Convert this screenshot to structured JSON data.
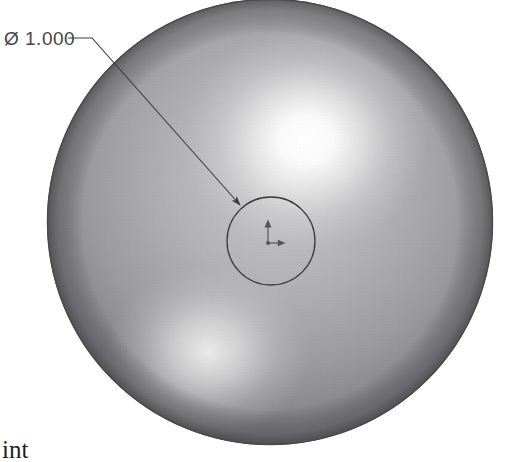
{
  "document": {
    "type": "engineering-drawing",
    "view_name": "sphere-isometric-view",
    "background_color": "#ffffff"
  },
  "annotations": {
    "diameter_callout": {
      "symbol": "Ø",
      "value": "1.000",
      "full_text": "Ø 1.000",
      "color": "#46464a",
      "leader": {
        "shoulder_start_x": 68,
        "shoulder_start_y": 38,
        "elbow_x": 92,
        "elbow_y": 38,
        "arrow_tip_x": 240,
        "arrow_tip_y": 205
      }
    },
    "caption": {
      "text": "int",
      "note": "clipped text at lower-left edge",
      "color": "#1d1d1f"
    }
  },
  "geometry": {
    "sphere": {
      "name": "shaded-sphere",
      "center_x": 270,
      "center_y": 222,
      "radius": 223,
      "edge_color": "#4a4a4c",
      "base_color": "#8e8e90",
      "shadow_color": "#4f4f52",
      "highlights": [
        {
          "name": "primary-specular-highlight",
          "x": 306,
          "y": 140,
          "radius": 118,
          "color": "#ffffff"
        },
        {
          "name": "secondary-highlight",
          "x": 208,
          "y": 352,
          "radius": 96,
          "color": "#e6e6e6"
        }
      ]
    },
    "inner_circle": {
      "name": "flat-face-circle",
      "center_x": 271,
      "center_y": 241,
      "radius": 44,
      "stroke_color": "#3b3b3d"
    },
    "origin_marker": {
      "name": "coordinate-origin-triad",
      "x": 268,
      "y": 243,
      "vertical_length": 22,
      "horizontal_length": 16,
      "color": "#55555a"
    }
  }
}
